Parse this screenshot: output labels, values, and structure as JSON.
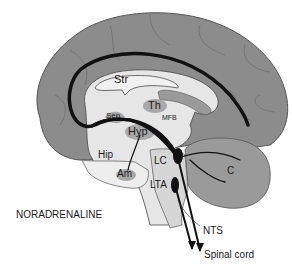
{
  "diagram": {
    "title": "NORADRENALINE",
    "colors": {
      "cortex": "#8c8c8c",
      "cortex_dark": "#7a7a7a",
      "inner": "#e6e6e6",
      "structure": "#a8a8a8",
      "pathway": "#111111",
      "background": "#ffffff"
    },
    "labels": {
      "str": "Str",
      "th": "Th",
      "sep": "Sep",
      "mfb": "MFB",
      "hyp": "Hyp",
      "hip": "Hip",
      "am": "Am",
      "lc": "LC",
      "lta": "LTA",
      "c": "C",
      "nts": "NTS",
      "spinal_cord": "Spinal cord"
    }
  }
}
